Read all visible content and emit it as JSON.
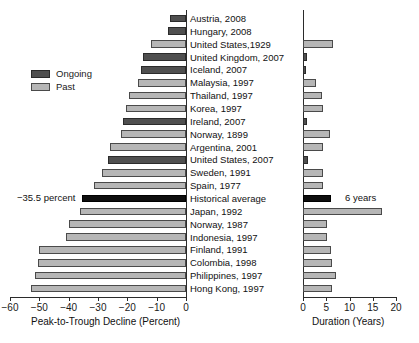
{
  "chart_data": {
    "type": "bar",
    "title": "",
    "orientation": "horizontal",
    "panels": [
      {
        "id": "decline",
        "xlabel": "Peak-to-Trough Decline (Percent)",
        "xlim": [
          -60,
          0
        ],
        "xticks": [
          -60,
          -50,
          -40,
          -30,
          -20,
          -10,
          0
        ],
        "xticklabels": [
          "−60",
          "−50",
          "−40",
          "−30",
          "−20",
          "−10",
          "0"
        ],
        "grid": false
      },
      {
        "id": "duration",
        "xlabel": "Duration (Years)",
        "xlim": [
          0,
          20
        ],
        "xticks": [
          0,
          5,
          10,
          15,
          20
        ],
        "xticklabels": [
          "0",
          "5",
          "10",
          "15",
          "20"
        ],
        "grid": false
      }
    ],
    "legend": {
      "position": "upper-left",
      "entries": [
        {
          "label": "Ongoing",
          "color": "#4f4f4f",
          "key": "ongoing"
        },
        {
          "label": "Past",
          "color": "#b6b6b6",
          "key": "past"
        }
      ]
    },
    "annotations": [
      {
        "text": "−35.5 percent",
        "target": "Historical average",
        "panel": "decline"
      },
      {
        "text": "6 years",
        "target": "Historical average",
        "panel": "duration"
      }
    ],
    "categories": [
      "Austria, 2008",
      "Hungary, 2008",
      "United States,1929",
      "United Kingdom, 2007",
      "Iceland, 2007",
      "Malaysia, 1997",
      "Thailand, 1997",
      "Korea, 1997",
      "Ireland, 2007",
      "Norway, 1899",
      "Argentina, 2001",
      "United States, 2007",
      "Sweden, 1991",
      "Spain, 1977",
      "Historical average",
      "Japan, 1992",
      "Norway, 1987",
      "Indonesia, 1997",
      "Finland, 1991",
      "Colombia, 1998",
      "Philippines, 1997",
      "Hong Kong, 1997"
    ],
    "series": [
      {
        "name": "Peak-to-Trough Decline (Percent)",
        "panel": "decline",
        "values": [
          -5.5,
          -6.0,
          -12.0,
          -14.5,
          -15.5,
          -16.5,
          -19.5,
          -20.5,
          -21.5,
          -22.0,
          -26.0,
          -26.5,
          -28.5,
          -31.5,
          -35.5,
          -36.0,
          -40.0,
          -41.0,
          -50.0,
          -50.5,
          -51.5,
          -53.0
        ]
      },
      {
        "name": "Duration (Years)",
        "panel": "duration",
        "values": [
          0.0,
          0.0,
          6.5,
          0.8,
          0.7,
          2.7,
          4.0,
          4.2,
          0.9,
          5.8,
          4.2,
          1.0,
          4.2,
          4.2,
          6.0,
          17.0,
          5.2,
          5.2,
          6.0,
          6.2,
          7.2,
          6.2
        ]
      }
    ],
    "status": [
      "ongoing",
      "ongoing",
      "past",
      "ongoing",
      "ongoing",
      "past",
      "past",
      "past",
      "ongoing",
      "past",
      "past",
      "ongoing",
      "past",
      "past",
      "average",
      "past",
      "past",
      "past",
      "past",
      "past",
      "past",
      "past"
    ]
  },
  "caption": {
    "text": ""
  }
}
